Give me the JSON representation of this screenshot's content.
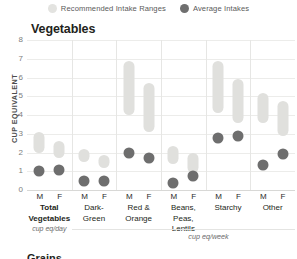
{
  "legend": {
    "items": [
      {
        "key": "range",
        "label": "Recommended Intake Ranges",
        "color": "#e3e3e0",
        "icon": "circle-swatch-icon"
      },
      {
        "key": "avg",
        "label": "Average Intakes",
        "color": "#6f6f6f",
        "icon": "circle-swatch-icon"
      }
    ]
  },
  "chart_data": {
    "type": "bar",
    "title": "Vegetables",
    "subtitle": "",
    "ylabel": "CUP EQUIVALENT",
    "xlabel": "",
    "ylim": [
      0,
      8
    ],
    "yticks": [
      "0",
      "1",
      "2",
      "3",
      "4",
      "5",
      "6",
      "7",
      "8"
    ],
    "grid": true,
    "legend_position": "top-center",
    "series": [
      {
        "name": "Recommended Intake Ranges",
        "type": "range",
        "color": "#e0e0dd"
      },
      {
        "name": "Average Intakes",
        "type": "point",
        "color": "#6e6e6e"
      }
    ],
    "categories": [
      "Total Vegetables",
      "Dark-Green",
      "Red & Orange",
      "Beans, Peas, Lentils",
      "Starchy",
      "Other"
    ],
    "category_units": [
      "cup eq/day",
      "cup eq/week",
      "cup eq/week",
      "cup eq/week",
      "cup eq/week",
      "cup eq/week"
    ],
    "sex_labels": [
      "M",
      "F"
    ],
    "groups": [
      {
        "category": "Total Vegetables",
        "unit": "cup eq/day",
        "lines": [
          "Total",
          "Vegetables"
        ],
        "bold": true,
        "points": [
          {
            "sex": "M",
            "range_low": 2.0,
            "range_high": 3.1,
            "average": 1.0
          },
          {
            "sex": "F",
            "range_low": 1.7,
            "range_high": 2.6,
            "average": 1.05
          }
        ]
      },
      {
        "category": "Dark-Green",
        "unit": "cup eq/week",
        "lines": [
          "Dark-",
          "Green"
        ],
        "bold": false,
        "points": [
          {
            "sex": "M",
            "range_low": 1.5,
            "range_high": 2.2,
            "average": 0.5
          },
          {
            "sex": "F",
            "range_low": 1.2,
            "range_high": 1.85,
            "average": 0.5
          }
        ]
      },
      {
        "category": "Red & Orange",
        "unit": "cup eq/week",
        "lines": [
          "Red &",
          "Orange"
        ],
        "bold": false,
        "points": [
          {
            "sex": "M",
            "range_low": 4.0,
            "range_high": 6.9,
            "average": 2.0
          },
          {
            "sex": "F",
            "range_low": 3.1,
            "range_high": 5.7,
            "average": 1.7
          }
        ]
      },
      {
        "category": "Beans, Peas, Lentils",
        "unit": "cup eq/week",
        "lines": [
          "Beans,",
          "Peas,",
          "Lentils"
        ],
        "bold": false,
        "points": [
          {
            "sex": "M",
            "range_low": 1.4,
            "range_high": 2.35,
            "average": 0.4
          },
          {
            "sex": "F",
            "range_low": 0.9,
            "range_high": 1.95,
            "average": 0.75
          }
        ]
      },
      {
        "category": "Starchy",
        "unit": "cup eq/week",
        "lines": [
          "Starchy"
        ],
        "bold": false,
        "points": [
          {
            "sex": "M",
            "range_low": 4.1,
            "range_high": 6.9,
            "average": 2.75
          },
          {
            "sex": "F",
            "range_low": 3.6,
            "range_high": 5.9,
            "average": 2.9
          }
        ]
      },
      {
        "category": "Other",
        "unit": "cup eq/week",
        "lines": [
          "Other"
        ],
        "bold": false,
        "points": [
          {
            "sex": "M",
            "range_low": 3.6,
            "range_high": 5.2,
            "average": 1.35
          },
          {
            "sex": "F",
            "range_low": 2.9,
            "range_high": 4.75,
            "average": 1.9
          }
        ]
      }
    ],
    "shared_unit_note": "cup eq/week"
  },
  "footer": {
    "clipped_next_title": "Grains"
  }
}
